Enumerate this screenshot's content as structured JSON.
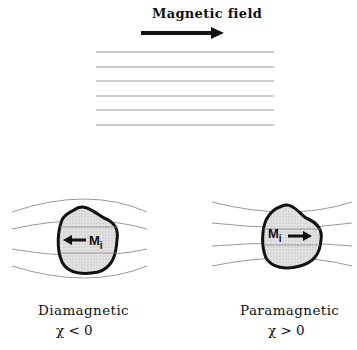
{
  "header": {
    "title": "Magnetic field"
  },
  "panels": [
    {
      "name": "Diamagnetic",
      "susceptibility": "χ < 0",
      "moment_label": "M",
      "moment_subscript": "i",
      "moment_direction": "left"
    },
    {
      "name": "Paramagnetic",
      "susceptibility": "χ > 0",
      "moment_label": "M",
      "moment_subscript": "i",
      "moment_direction": "right"
    }
  ],
  "colors": {
    "field_lines": "#999999",
    "outline": "#111111",
    "fill": "#d9d9d9"
  }
}
